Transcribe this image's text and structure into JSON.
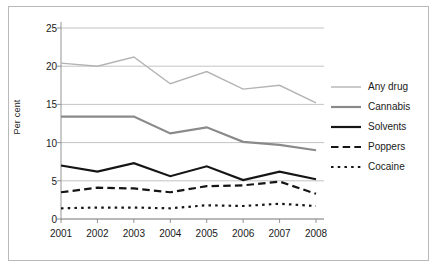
{
  "chart_data": {
    "type": "line",
    "title": "",
    "xlabel": "",
    "ylabel": "Per cent",
    "categories": [
      "2001",
      "2002",
      "2003",
      "2004",
      "2005",
      "2006",
      "2007",
      "2008"
    ],
    "x": [
      2001,
      2002,
      2003,
      2004,
      2005,
      2006,
      2007,
      2008
    ],
    "ylim": [
      0,
      25
    ],
    "yticks": [
      0,
      5,
      10,
      15,
      20,
      25
    ],
    "ytick_labels": [
      "0",
      "5",
      "10",
      "15",
      "20",
      "25"
    ],
    "grid": "horizontal",
    "legend_position": "right",
    "series": [
      {
        "name": "Any drug",
        "color": "#b3b3b3",
        "style": "solid",
        "width": 1.4,
        "values": [
          20.4,
          20.0,
          21.2,
          17.7,
          19.3,
          17.0,
          17.5,
          15.2
        ]
      },
      {
        "name": "Cannabis",
        "color": "#8a8a8a",
        "style": "solid",
        "width": 2.2,
        "values": [
          13.4,
          13.4,
          13.4,
          11.2,
          12.0,
          10.1,
          9.7,
          9.0
        ]
      },
      {
        "name": "Solvents",
        "color": "#151515",
        "style": "solid",
        "width": 2.2,
        "values": [
          7.0,
          6.2,
          7.3,
          5.6,
          6.9,
          5.1,
          6.2,
          5.2
        ]
      },
      {
        "name": "Poppers",
        "color": "#151515",
        "style": "dashed",
        "width": 2.2,
        "values": [
          3.5,
          4.1,
          4.0,
          3.5,
          4.3,
          4.4,
          4.9,
          3.3
        ]
      },
      {
        "name": "Cocaine",
        "color": "#151515",
        "style": "dotted",
        "width": 2.2,
        "values": [
          1.4,
          1.5,
          1.5,
          1.4,
          1.8,
          1.7,
          2.0,
          1.7
        ]
      }
    ]
  },
  "style": {
    "background": "#ffffff",
    "border_color": "#b9b9b9",
    "grid_color": "#aaaaaa",
    "axis_color": "#888888",
    "text_color": "#1a1a1a"
  }
}
